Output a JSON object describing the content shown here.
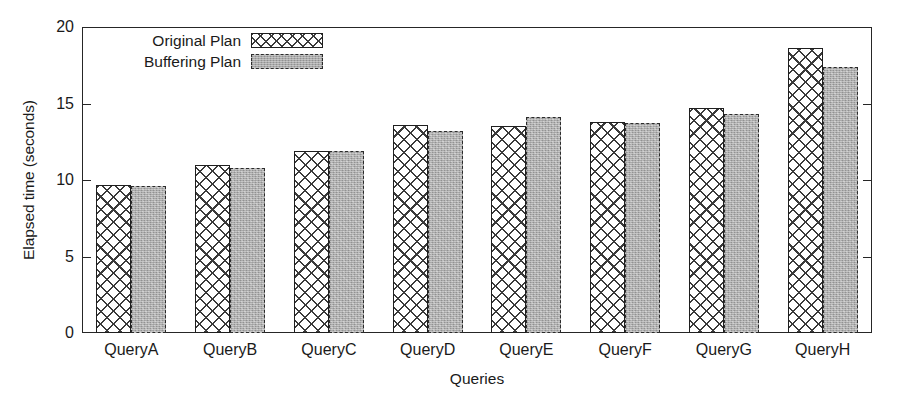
{
  "chart_data": {
    "type": "bar",
    "title": "",
    "xlabel": "Queries",
    "ylabel": "Elapsed time (seconds)",
    "categories": [
      "QueryA",
      "QueryB",
      "QueryC",
      "QueryD",
      "QueryE",
      "QueryF",
      "QueryG",
      "QueryH"
    ],
    "series": [
      {
        "name": "Original Plan",
        "values": [
          9.7,
          11.0,
          11.9,
          13.6,
          13.5,
          13.8,
          14.7,
          18.6
        ],
        "fill": "crosshatch-white",
        "border_color": "#1f1f1f",
        "border_style": "solid"
      },
      {
        "name": "Buffering Plan",
        "values": [
          9.6,
          10.8,
          11.9,
          13.2,
          14.1,
          13.7,
          14.3,
          17.4
        ],
        "fill": "stippled-gray",
        "fill_color": "#a9a9a9",
        "border_color": "#2b2b2b",
        "border_style": "dashed"
      }
    ],
    "ylim": [
      0,
      20
    ],
    "yticks": [
      0,
      5,
      10,
      15,
      20
    ],
    "ytick_labels": [
      "0",
      "5",
      "10",
      "15",
      "20"
    ],
    "grid": false,
    "legend_position": "top-center-left",
    "axis_color": "#262626",
    "background": "#ffffff"
  },
  "legend": {
    "entries": [
      {
        "label": "Original Plan"
      },
      {
        "label": "Buffering Plan"
      }
    ]
  }
}
